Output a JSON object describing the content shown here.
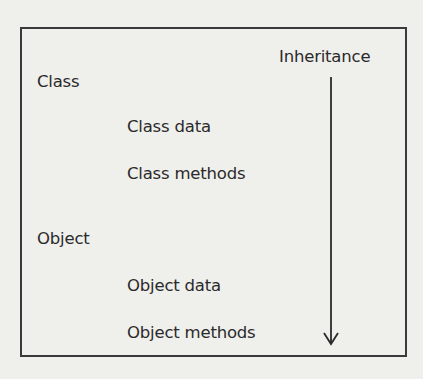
{
  "diagram": {
    "type": "inheritance-hierarchy",
    "arrow_label": "Inheritance",
    "arrow_direction": "down",
    "levels": [
      {
        "title": "Class",
        "members": [
          "Class data",
          "Class methods"
        ]
      },
      {
        "title": "Object",
        "members": [
          "Object data",
          "Object methods"
        ]
      }
    ]
  },
  "colors": {
    "background": "#efefec",
    "ink": "#2a2a2a",
    "frame": "#3a3a3a"
  }
}
